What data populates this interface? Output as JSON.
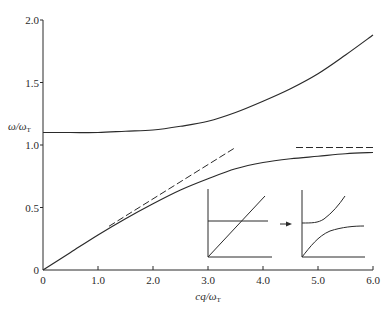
{
  "chart_data": {
    "type": "line",
    "title": "",
    "xlabel": "cq/ω",
    "xlabel_sub": "T",
    "ylabel": "ω/ω",
    "ylabel_sub": "T",
    "xlim": [
      0,
      6.0
    ],
    "ylim": [
      0,
      2.0
    ],
    "xticks": [
      "0",
      "1.0",
      "2.0",
      "3.0",
      "4.0",
      "5.0",
      "6.0"
    ],
    "yticks": [
      "0",
      "0.5",
      "1.0",
      "1.5",
      "2.0"
    ],
    "grid": false,
    "legend": null,
    "series": [
      {
        "name": "upper-branch",
        "style": "solid",
        "x": [
          0,
          0.5,
          1.0,
          1.5,
          2.0,
          2.5,
          3.0,
          3.5,
          4.0,
          4.5,
          5.0,
          5.5,
          6.0
        ],
        "y": [
          1.1,
          1.1,
          1.1,
          1.11,
          1.12,
          1.15,
          1.19,
          1.26,
          1.35,
          1.45,
          1.57,
          1.72,
          1.88
        ]
      },
      {
        "name": "lower-branch",
        "style": "solid",
        "x": [
          0,
          0.5,
          1.0,
          1.5,
          2.0,
          2.5,
          3.0,
          3.5,
          4.0,
          4.5,
          5.0,
          5.5,
          6.0
        ],
        "y": [
          0,
          0.14,
          0.28,
          0.41,
          0.53,
          0.64,
          0.73,
          0.81,
          0.86,
          0.89,
          0.91,
          0.93,
          0.94
        ]
      },
      {
        "name": "light-line-asymptote",
        "style": "dashed",
        "x": [
          1.2,
          3.5
        ],
        "y": [
          0.35,
          0.98
        ]
      },
      {
        "name": "high-q-asymptote",
        "style": "dashed",
        "x": [
          4.6,
          6.0
        ],
        "y": [
          0.98,
          0.98
        ]
      }
    ],
    "annotations": [
      {
        "type": "inset",
        "description": "uncoupled dispersion: horizontal line crossing diagonal line"
      },
      {
        "type": "arrow",
        "description": "arrow from uncoupled to coupled inset"
      },
      {
        "type": "inset",
        "description": "coupled dispersion: two anti-crossing branches"
      }
    ]
  }
}
